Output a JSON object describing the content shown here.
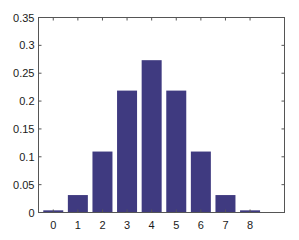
{
  "chart_data": {
    "type": "bar",
    "title": "",
    "xlabel": "",
    "ylabel": "",
    "categories": [
      "0",
      "1",
      "2",
      "3",
      "4",
      "5",
      "6",
      "7",
      "8"
    ],
    "values": [
      0.0039,
      0.0313,
      0.1094,
      0.2188,
      0.2734,
      0.2188,
      0.1094,
      0.0313,
      0.0039
    ],
    "ylim": [
      0,
      0.35
    ],
    "xlim": [
      -0.6,
      9.4
    ],
    "yticks": [
      "0",
      "0.05",
      "0.1",
      "0.15",
      "0.2",
      "0.25",
      "0.3",
      "0.35"
    ],
    "ytick_values": [
      0,
      0.05,
      0.1,
      0.15,
      0.2,
      0.25,
      0.3,
      0.35
    ],
    "grid": false,
    "legend": null,
    "bar_color": "#3f3a80"
  }
}
